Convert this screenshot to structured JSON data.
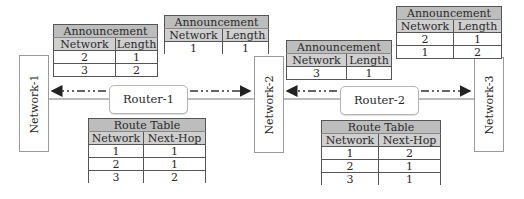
{
  "networks": [
    {
      "label": "Network-1"
    },
    {
      "label": "Network-2"
    },
    {
      "label": "Network-3"
    }
  ],
  "routers": [
    {
      "label": "Router-1"
    },
    {
      "label": "Router-2"
    }
  ],
  "announcements": [
    {
      "title": "Announcement",
      "columns": [
        "Network",
        "Length"
      ],
      "rows": [
        [
          "2",
          "1"
        ],
        [
          "3",
          "2"
        ]
      ],
      "from": "Router-1",
      "to": "Network-1"
    },
    {
      "title": "Announcement",
      "columns": [
        "Network",
        "Length"
      ],
      "rows": [
        [
          "1",
          "1"
        ]
      ],
      "from": "Router-1",
      "to": "Network-2"
    },
    {
      "title": "Announcement",
      "columns": [
        "Network",
        "Length"
      ],
      "rows": [
        [
          "3",
          "1"
        ]
      ],
      "from": "Router-2",
      "to": "Network-2"
    },
    {
      "title": "Announcement",
      "columns": [
        "Network",
        "Length"
      ],
      "rows": [
        [
          "2",
          "1"
        ],
        [
          "1",
          "2"
        ]
      ],
      "from": "Router-2",
      "to": "Network-3"
    }
  ],
  "route_tables": [
    {
      "title": "Route Table",
      "columns": [
        "Network",
        "Next-Hop"
      ],
      "rows": [
        [
          "1",
          "1"
        ],
        [
          "2",
          "1"
        ],
        [
          "3",
          "2"
        ]
      ],
      "router": "Router-1"
    },
    {
      "title": "Route Table",
      "columns": [
        "Network",
        "Next-Hop"
      ],
      "rows": [
        [
          "1",
          "2"
        ],
        [
          "2",
          "1"
        ],
        [
          "3",
          "1"
        ]
      ],
      "router": "Router-2"
    }
  ],
  "colors": {
    "title_fill": "#bdbdbd",
    "header_fill": "#cfcfcf",
    "border": "#555555",
    "arrow": "#222222"
  }
}
